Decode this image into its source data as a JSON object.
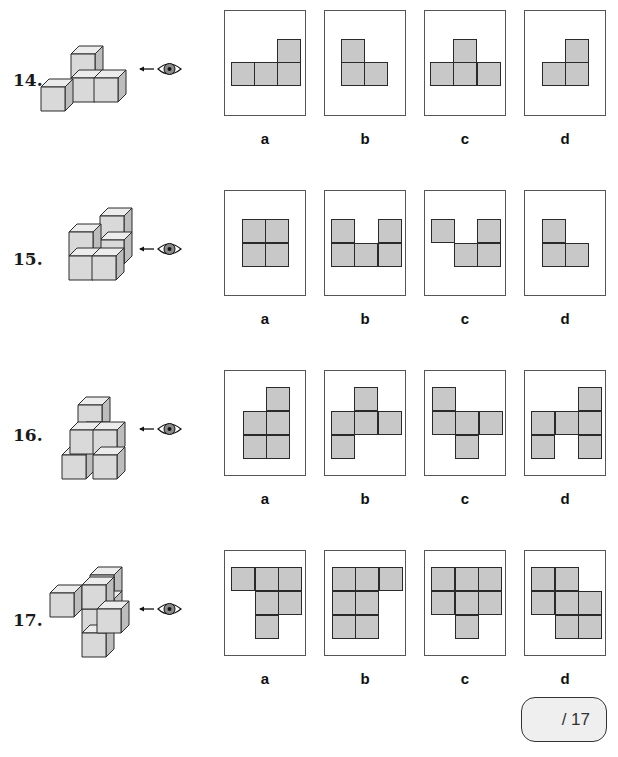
{
  "colors": {
    "square_fill": "#c8c8c8",
    "cube_front": "#d9d9d9",
    "cube_top": "#ececec",
    "cube_side": "#bdbdbd",
    "stroke": "#2a2a2a"
  },
  "score": {
    "label": "/ 17"
  },
  "questions": [
    {
      "number": "14.",
      "num_pos": [
        13,
        70
      ],
      "viewer_pos": [
        138,
        58
      ],
      "cubes": [
        [
          71,
          54
        ],
        [
          71,
          78
        ],
        [
          94,
          78
        ],
        [
          41,
          87
        ]
      ],
      "box_top": 10,
      "options": [
        {
          "label": "a",
          "squares": [
            [
              53,
              29
            ],
            [
              7,
              52
            ],
            [
              30,
              52
            ],
            [
              53,
              52
            ]
          ]
        },
        {
          "label": "b",
          "squares": [
            [
              17,
              29
            ],
            [
              17,
              52
            ],
            [
              40,
              52
            ]
          ]
        },
        {
          "label": "c",
          "squares": [
            [
              29,
              29
            ],
            [
              6,
              52
            ],
            [
              29,
              52
            ],
            [
              53,
              52
            ]
          ]
        },
        {
          "label": "d",
          "squares": [
            [
              41,
              29
            ],
            [
              18,
              52
            ],
            [
              41,
              52
            ]
          ]
        }
      ]
    },
    {
      "number": "15.",
      "num_pos": [
        13,
        249
      ],
      "viewer_pos": [
        138,
        238
      ],
      "cubes": [
        [
          100,
          216
        ],
        [
          100,
          240
        ],
        [
          69,
          232
        ],
        [
          69,
          256
        ],
        [
          92,
          256
        ]
      ],
      "box_top": 190,
      "options": [
        {
          "label": "a",
          "squares": [
            [
              18,
              29
            ],
            [
              41,
              29
            ],
            [
              18,
              53
            ],
            [
              41,
              53
            ]
          ]
        },
        {
          "label": "b",
          "squares": [
            [
              7,
              29
            ],
            [
              54,
              29
            ],
            [
              7,
              53
            ],
            [
              30,
              53
            ],
            [
              54,
              53
            ]
          ]
        },
        {
          "label": "c",
          "squares": [
            [
              7,
              29
            ],
            [
              53,
              29
            ],
            [
              30,
              53
            ],
            [
              53,
              53
            ]
          ]
        },
        {
          "label": "d",
          "squares": [
            [
              18,
              29
            ],
            [
              18,
              53
            ],
            [
              41,
              53
            ]
          ]
        }
      ]
    },
    {
      "number": "16.",
      "num_pos": [
        13,
        425
      ],
      "viewer_pos": [
        138,
        418
      ],
      "cubes": [
        [
          78,
          405
        ],
        [
          78,
          430
        ],
        [
          62,
          455
        ],
        [
          70,
          430
        ],
        [
          93,
          430
        ],
        [
          93,
          455
        ]
      ],
      "box_top": 370,
      "options": [
        {
          "label": "a",
          "squares": [
            [
              42,
              17
            ],
            [
              19,
              41
            ],
            [
              42,
              41
            ],
            [
              19,
              65
            ],
            [
              42,
              65
            ]
          ]
        },
        {
          "label": "b",
          "squares": [
            [
              30,
              17
            ],
            [
              7,
              41
            ],
            [
              30,
              41
            ],
            [
              54,
              41
            ],
            [
              7,
              65
            ]
          ]
        },
        {
          "label": "c",
          "squares": [
            [
              8,
              17
            ],
            [
              8,
              41
            ],
            [
              31,
              41
            ],
            [
              55,
              41
            ],
            [
              31,
              65
            ]
          ]
        },
        {
          "label": "d",
          "squares": [
            [
              54,
              17
            ],
            [
              7,
              41
            ],
            [
              31,
              41
            ],
            [
              54,
              41
            ],
            [
              7,
              65
            ],
            [
              54,
              65
            ]
          ]
        }
      ]
    },
    {
      "number": "17.",
      "num_pos": [
        13,
        610
      ],
      "viewer_pos": [
        138,
        598
      ],
      "cubes": [
        [
          90,
          575
        ],
        [
          90,
          599
        ],
        [
          82,
          609
        ],
        [
          82,
          633
        ],
        [
          50,
          593
        ],
        [
          82,
          585
        ],
        [
          97,
          609
        ]
      ],
      "box_top": 550,
      "options": [
        {
          "label": "a",
          "squares": [
            [
              7,
              17
            ],
            [
              31,
              17
            ],
            [
              54,
              17
            ],
            [
              31,
              41
            ],
            [
              54,
              41
            ],
            [
              31,
              65
            ]
          ]
        },
        {
          "label": "b",
          "squares": [
            [
              8,
              17
            ],
            [
              31,
              17
            ],
            [
              55,
              17
            ],
            [
              8,
              41
            ],
            [
              31,
              41
            ],
            [
              8,
              65
            ],
            [
              31,
              65
            ]
          ]
        },
        {
          "label": "c",
          "squares": [
            [
              7,
              17
            ],
            [
              31,
              17
            ],
            [
              54,
              17
            ],
            [
              7,
              41
            ],
            [
              31,
              41
            ],
            [
              54,
              41
            ],
            [
              31,
              65
            ]
          ]
        },
        {
          "label": "d",
          "squares": [
            [
              7,
              17
            ],
            [
              31,
              17
            ],
            [
              7,
              41
            ],
            [
              31,
              41
            ],
            [
              54,
              41
            ],
            [
              31,
              65
            ],
            [
              54,
              65
            ]
          ]
        }
      ]
    }
  ],
  "option_box_lefts": [
    224,
    324,
    424,
    524
  ]
}
